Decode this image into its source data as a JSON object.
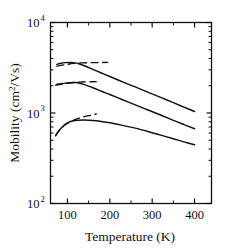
{
  "chart_data": {
    "type": "line",
    "title": "",
    "xlabel": "Temperature (K)",
    "ylabel": "Mobility (cm2/Vs)",
    "ylabel_parts": {
      "main": "Mobility (cm",
      "sup": "2",
      "tail": "/Vs)"
    },
    "xscale": "linear",
    "yscale": "log",
    "xlim": [
      60,
      440
    ],
    "ylim": [
      100,
      10000
    ],
    "xticks": [
      100,
      200,
      300,
      400
    ],
    "xtick_labels": [
      "100",
      "200",
      "300",
      "400"
    ],
    "xticks_minor": [
      50,
      150,
      250,
      350
    ],
    "yticks": [
      100,
      1000,
      10000
    ],
    "ytick_labels": [
      "10",
      "10",
      "10"
    ],
    "ytick_exponents": [
      "2",
      "3",
      "4"
    ],
    "grid": false,
    "legend": null,
    "frame": "box",
    "series": [
      {
        "name": "upper-solid",
        "style": "solid",
        "x": [
          75,
          85,
          95,
          105,
          115,
          125,
          140,
          160,
          180,
          200,
          230,
          260,
          290,
          320,
          350,
          375,
          400
        ],
        "y": [
          3450,
          3550,
          3600,
          3620,
          3600,
          3520,
          3330,
          3040,
          2770,
          2530,
          2210,
          1940,
          1700,
          1490,
          1300,
          1160,
          1040
        ]
      },
      {
        "name": "upper-dashed-branch",
        "style": "dashed",
        "x": [
          75,
          95,
          115,
          135,
          155,
          175,
          195
        ],
        "y": [
          3300,
          3420,
          3530,
          3580,
          3600,
          3610,
          3620
        ]
      },
      {
        "name": "middle-solid",
        "style": "solid",
        "x": [
          75,
          85,
          95,
          105,
          115,
          125,
          140,
          160,
          180,
          200,
          230,
          260,
          290,
          320,
          350,
          375,
          400
        ],
        "y": [
          2080,
          2110,
          2140,
          2160,
          2170,
          2160,
          2060,
          1900,
          1740,
          1600,
          1400,
          1230,
          1080,
          950,
          830,
          745,
          670
        ]
      },
      {
        "name": "middle-dashed-branch",
        "style": "dashed",
        "x": [
          72,
          85,
          100,
          118,
          135,
          152,
          168
        ],
        "y": [
          2030,
          2080,
          2130,
          2180,
          2200,
          2210,
          2220
        ]
      },
      {
        "name": "lower-solid",
        "style": "solid",
        "x": [
          72,
          80,
          90,
          100,
          112,
          125,
          140,
          160,
          180,
          200,
          230,
          260,
          290,
          320,
          350,
          375,
          400
        ],
        "y": [
          560,
          640,
          720,
          780,
          815,
          830,
          835,
          825,
          805,
          780,
          730,
          680,
          625,
          570,
          520,
          480,
          445
        ]
      },
      {
        "name": "lower-dashed-branch",
        "style": "dashed",
        "x": [
          72,
          82,
          95,
          110,
          125,
          140,
          155,
          168
        ],
        "y": [
          565,
          650,
          740,
          810,
          870,
          910,
          945,
          975
        ]
      }
    ]
  }
}
